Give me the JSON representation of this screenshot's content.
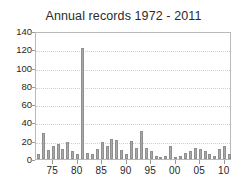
{
  "chart_data": {
    "type": "bar",
    "title": "Annual records 1972 - 2011",
    "xlabel": "",
    "ylabel": "",
    "ylim": [
      0,
      140
    ],
    "yticks": [
      0,
      20,
      40,
      60,
      80,
      100,
      120,
      140
    ],
    "ytick_labels": [
      "0",
      "20",
      "40",
      "60",
      "80",
      "100",
      "120",
      "140"
    ],
    "grid": true,
    "legend": "none",
    "xtick_labels": [
      "75",
      "80",
      "85",
      "90",
      "95",
      "00",
      "05",
      "10"
    ],
    "xtick_years": [
      1975,
      1980,
      1985,
      1990,
      1995,
      2000,
      2005,
      2010
    ],
    "categories": [
      "1972",
      "1973",
      "1974",
      "1975",
      "1976",
      "1977",
      "1978",
      "1979",
      "1980",
      "1981",
      "1982",
      "1983",
      "1984",
      "1985",
      "1986",
      "1987",
      "1988",
      "1989",
      "1990",
      "1991",
      "1992",
      "1993",
      "1994",
      "1995",
      "1996",
      "1997",
      "1998",
      "1999",
      "2000",
      "2001",
      "2002",
      "2003",
      "2004",
      "2005",
      "2006",
      "2007",
      "2008",
      "2009",
      "2010",
      "2011"
    ],
    "values": [
      5,
      28,
      10,
      14,
      16,
      11,
      19,
      9,
      6,
      121,
      7,
      5,
      11,
      19,
      14,
      22,
      21,
      10,
      5,
      20,
      12,
      31,
      12,
      9,
      3,
      2,
      3,
      14,
      2,
      3,
      7,
      9,
      12,
      11,
      9,
      6,
      3,
      11,
      14,
      6
    ],
    "values_tail": [
      3,
      3,
      3,
      2,
      5,
      6,
      7,
      10,
      4
    ],
    "bar_color": "#a9a9a9",
    "bar_edge_color": "#8f8f8f",
    "axis_color": "#b9b9b9",
    "grid_color": "#cfcfcf",
    "text_color": "#1f1f1f",
    "background": "#ffffff"
  }
}
